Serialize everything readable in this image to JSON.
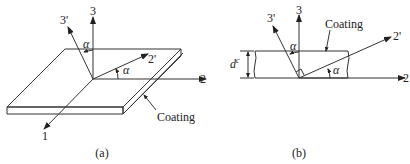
{
  "panel_a": {
    "caption": "(a)",
    "axes": {
      "axis_1": "1",
      "axis_2": "2",
      "axis_3": "3",
      "axis_2p": "2'",
      "axis_3p": "3'"
    },
    "angle_labels": [
      "α",
      "α"
    ],
    "coating_label": "Coating"
  },
  "panel_b": {
    "caption": "(b)",
    "axes": {
      "axis_2": "2",
      "axis_3": "3",
      "axis_2p": "2'",
      "axis_3p": "3'"
    },
    "angle_labels": [
      "α",
      "α"
    ],
    "coating_label": "Coating",
    "thickness_label": "d",
    "thickness_superscript": "c"
  },
  "colors": {
    "ink": "#333333",
    "background": "#ffffff"
  }
}
